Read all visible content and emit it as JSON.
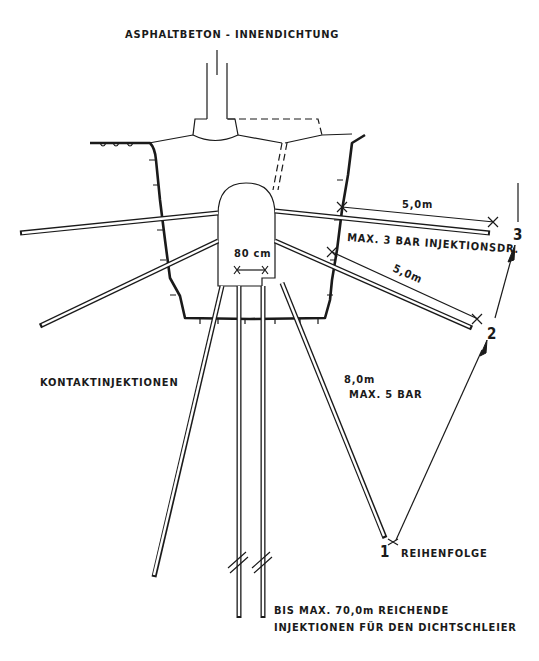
{
  "title": "ASPHALTBETON - INNENDICHTUNG",
  "labels": {
    "contact_injections": "KONTAKTINJEKTIONEN",
    "dim_upper": "5,0m",
    "pressure_upper": "MAX. 3 BAR INJEKTIONSDR.",
    "dim_middle": "5,0m",
    "dim_lower": "8,0m",
    "pressure_lower": "MAX. 5 BAR",
    "gallery_width": "80 cm",
    "sequence": "REIHENFOLGE",
    "curtain_line1": "BIS MAX. 70,0m REICHENDE",
    "curtain_line2": "INJEKTIONEN FÜR DEN DICHTSCHLEIER"
  },
  "sequence_steps": [
    "1",
    "2",
    "3"
  ],
  "colors": {
    "ink": "#1a1a1a",
    "paper": "#ffffff"
  }
}
